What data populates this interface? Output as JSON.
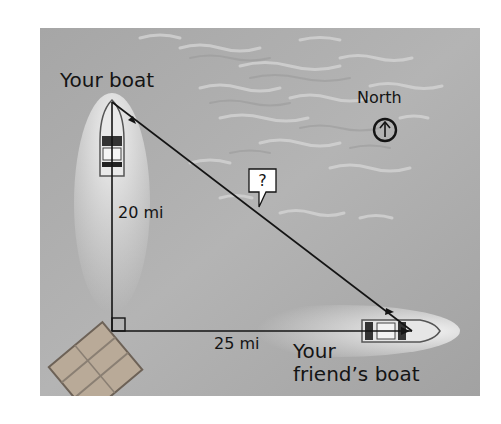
{
  "figure": {
    "type": "right-triangle word-problem illustration",
    "background": "aerial photo of water"
  },
  "labels": {
    "your_boat": "Your boat",
    "friend_boat_line1": "Your",
    "friend_boat_line2": "friend’s boat",
    "vertical_side": "20 mi",
    "horizontal_side": "25 mi",
    "hypotenuse": "?",
    "compass": "North"
  },
  "triangle": {
    "vertices": {
      "your_boat": [
        112,
        102
      ],
      "right_angle": [
        112,
        331
      ],
      "friend_boat": [
        412,
        331
      ]
    },
    "sides": {
      "vertical_mi": 20,
      "horizontal_mi": 25,
      "hypotenuse_mi": "?"
    },
    "right_angle_marker": true
  },
  "compass": {
    "direction": "up",
    "icon": "north-arrow-circle-icon"
  },
  "colors": {
    "line": "#141414",
    "water": "#a8a8a8",
    "text": "#141414",
    "callout_bg": "#ffffff"
  }
}
